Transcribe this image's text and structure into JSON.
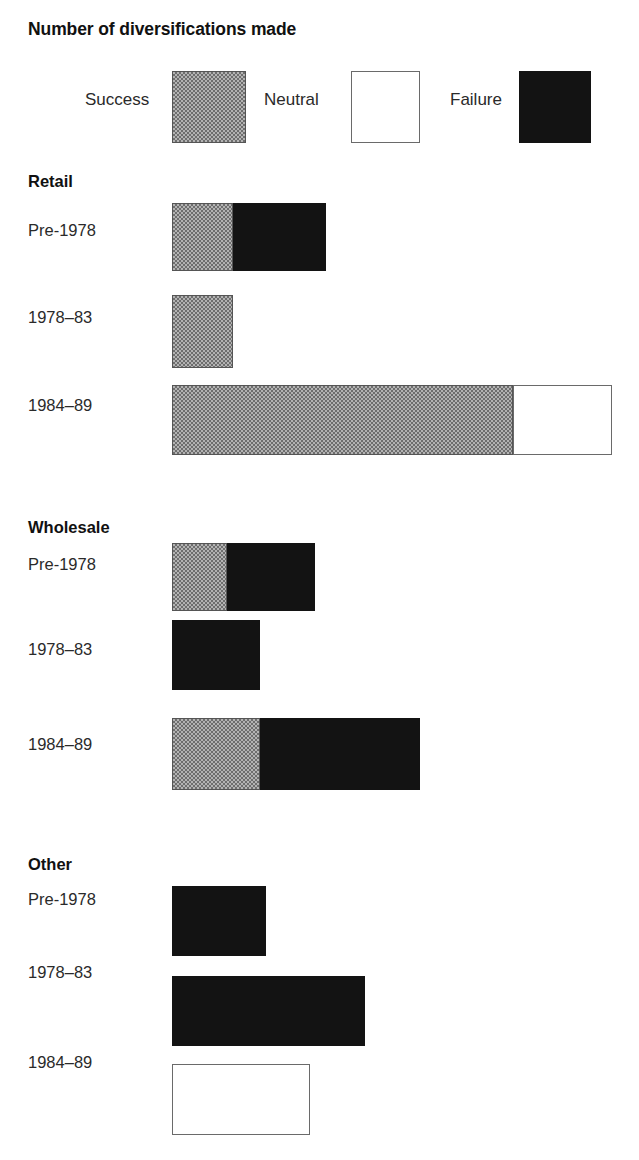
{
  "title": "Number of diversifications made",
  "legend": {
    "items": [
      {
        "label": "Success",
        "key": "success",
        "swatch": "gray-checkered-swatch"
      },
      {
        "label": "Neutral",
        "key": "neutral",
        "swatch": "white-outline-swatch"
      },
      {
        "label": "Failure",
        "key": "failure",
        "swatch": "black-swatch"
      }
    ]
  },
  "colors": {
    "success": "#999999",
    "neutral": "#ffffff",
    "failure": "#131313",
    "outline": "#555555",
    "text": "#1a1a1a"
  },
  "groups": [
    {
      "name": "Retail",
      "rows": [
        {
          "label": "Pre-1978"
        },
        {
          "label": "1978–83"
        },
        {
          "label": "1984–89"
        }
      ]
    },
    {
      "name": "Wholesale",
      "rows": [
        {
          "label": "Pre-1978"
        },
        {
          "label": "1978–83"
        },
        {
          "label": "1984–89"
        }
      ]
    },
    {
      "name": "Other",
      "rows": [
        {
          "label": "Pre-1978"
        },
        {
          "label": "1978–83"
        },
        {
          "label": "1984–89"
        }
      ]
    }
  ],
  "chart_data": {
    "type": "bar",
    "orientation": "horizontal",
    "stacked": true,
    "title": "Number of diversifications made",
    "xlabel": "",
    "ylabel": "",
    "grid": false,
    "legend_position": "top",
    "series": [
      {
        "name": "Success",
        "color": "#999999"
      },
      {
        "name": "Neutral",
        "color": "#ffffff"
      },
      {
        "name": "Failure",
        "color": "#131313"
      }
    ],
    "groups": [
      "Retail",
      "Wholesale",
      "Other"
    ],
    "categories": [
      "Pre-1978",
      "1978–83",
      "1984–89"
    ],
    "units": "diversifications",
    "axis_scale_px_per_unit": 11,
    "data": [
      {
        "group": "Retail",
        "rows": [
          {
            "category": "Pre-1978",
            "success": 5.5,
            "neutral": 0,
            "failure": 8.5,
            "total": 14
          },
          {
            "category": "1978–83",
            "success": 5.5,
            "neutral": 0,
            "failure": 0,
            "total": 5.5
          },
          {
            "category": "1984–89",
            "success": 31,
            "neutral": 9,
            "failure": 0,
            "total": 40
          }
        ]
      },
      {
        "group": "Wholesale",
        "rows": [
          {
            "category": "Pre-1978",
            "success": 5,
            "neutral": 0,
            "failure": 8,
            "total": 13
          },
          {
            "category": "1978–83",
            "success": 0,
            "neutral": 0,
            "failure": 8,
            "total": 8
          },
          {
            "category": "1984–89",
            "success": 8,
            "neutral": 0,
            "failure": 14.5,
            "total": 22.5
          }
        ]
      },
      {
        "group": "Other",
        "rows": [
          {
            "category": "Pre-1978",
            "success": 0,
            "neutral": 0,
            "failure": 8.5,
            "total": 8.5
          },
          {
            "category": "1978–83",
            "success": 0,
            "neutral": 0,
            "failure": 17.5,
            "total": 17.5
          },
          {
            "category": "1984–89",
            "success": 0,
            "neutral": 12.5,
            "failure": 0,
            "total": 12.5
          }
        ]
      }
    ]
  },
  "layout": {
    "bar_origin_x": 172,
    "px_per_unit": 11,
    "legend": {
      "items": [
        {
          "label_x": 85,
          "swatch_x": 172,
          "swatch_w": 72,
          "swatch_h": 70
        },
        {
          "label_x": 264,
          "swatch_x": 351,
          "swatch_w": 67,
          "swatch_h": 70
        },
        {
          "label_x": 450,
          "swatch_x": 519,
          "swatch_w": 70,
          "swatch_h": 70
        }
      ]
    },
    "groups": [
      {
        "heading_y": 172,
        "rows": [
          {
            "label_y": 221,
            "bar_y": 203,
            "bar_h": 68
          },
          {
            "label_y": 308,
            "bar_y": 295,
            "bar_h": 73
          },
          {
            "label_y": 396,
            "bar_y": 385,
            "bar_h": 70
          }
        ]
      },
      {
        "heading_y": 518,
        "rows": [
          {
            "label_y": 555,
            "bar_y": 543,
            "bar_h": 68
          },
          {
            "label_y": 640,
            "bar_y": 620,
            "bar_h": 70
          },
          {
            "label_y": 735,
            "bar_y": 718,
            "bar_h": 72
          }
        ]
      },
      {
        "heading_y": 855,
        "rows": [
          {
            "label_y": 890,
            "bar_y": 886,
            "bar_h": 70
          },
          {
            "label_y": 963,
            "bar_y": 976,
            "bar_h": 70
          },
          {
            "label_y": 1053,
            "bar_y": 1064,
            "bar_h": 71
          }
        ]
      }
    ]
  }
}
